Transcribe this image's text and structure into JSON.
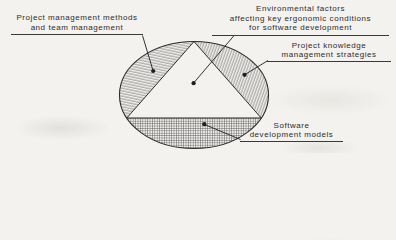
{
  "figure": {
    "type": "venn-ellipse-triangle-diagram",
    "labels": {
      "project_management": {
        "lines": [
          "Project management methods",
          "and team management"
        ]
      },
      "environmental_factors": {
        "lines": [
          "Environmental factors",
          "affecting key ergonomic conditions",
          "for software development"
        ]
      },
      "knowledge_management": {
        "lines": [
          "Project knowledge",
          "management strategies"
        ]
      },
      "software_models": {
        "lines": [
          "Software",
          "development models"
        ]
      }
    },
    "regions": {
      "left_lune": "Project management methods and team management",
      "triangle_center": "Environmental factors affecting key ergonomic conditions for software development",
      "right_lune": "Project knowledge management strategies",
      "bottom_segment": "Software development models"
    },
    "colors": {
      "ink": "#2b2b2b",
      "hatch": "#4a4a4a",
      "paper": "#f3f2ef",
      "text": "#2c2c2c"
    }
  }
}
